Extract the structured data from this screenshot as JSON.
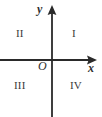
{
  "figure": {
    "type": "cartesian-coordinate-plane",
    "title": "",
    "background_color": "#ffffff",
    "stroke_color": "#2a2a2a",
    "text_color": "#3a3a3a",
    "width": 102,
    "height": 117
  },
  "axes": {
    "y_axis": {
      "label": "y",
      "orientation": "vertical",
      "arrow_direction": "up",
      "x_position": 52,
      "top": 5,
      "bottom": 117
    },
    "x_axis": {
      "label": "x",
      "orientation": "horizontal",
      "arrow_direction": "right",
      "y_position": 60,
      "left": 0,
      "right": 97
    },
    "origin": {
      "label": "O",
      "x": 52,
      "y": 60
    }
  },
  "quadrants": [
    {
      "id": "I",
      "label": "I",
      "position": "top-right"
    },
    {
      "id": "II",
      "label": "II",
      "position": "top-left"
    },
    {
      "id": "III",
      "label": "III",
      "position": "bottom-left"
    },
    {
      "id": "IV",
      "label": "IV",
      "position": "bottom-right"
    }
  ]
}
